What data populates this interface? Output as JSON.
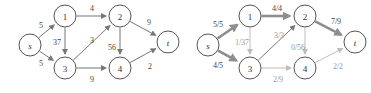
{
  "figure": {
    "title": "",
    "panels": [
      {
        "id": "left",
        "name": "capacity-network",
        "nodes": [
          {
            "id": "s",
            "label": "s",
            "x": 30,
            "y": 45,
            "r": 11,
            "italic": true
          },
          {
            "id": "n1",
            "label": "1",
            "x": 65,
            "y": 16,
            "r": 11,
            "italic": false
          },
          {
            "id": "n2",
            "label": "2",
            "x": 120,
            "y": 16,
            "r": 11,
            "italic": false
          },
          {
            "id": "n3",
            "label": "3",
            "x": 65,
            "y": 68,
            "r": 11,
            "italic": false
          },
          {
            "id": "n4",
            "label": "4",
            "x": 120,
            "y": 68,
            "r": 11,
            "italic": false
          },
          {
            "id": "t",
            "label": "t",
            "x": 168,
            "y": 42,
            "r": 11,
            "italic": true
          }
        ],
        "edges": [
          {
            "from": "s",
            "to": "n1",
            "label": "5",
            "lx": 41,
            "ly": 25,
            "style": "thin"
          },
          {
            "from": "s",
            "to": "n3",
            "label": "5",
            "lx": 41,
            "ly": 63,
            "style": "thin"
          },
          {
            "from": "n1",
            "to": "n2",
            "label": "4",
            "lx": 92,
            "ly": 8,
            "style": "thin"
          },
          {
            "from": "n1",
            "to": "n3",
            "label": "37",
            "lx": 57,
            "ly": 42,
            "style": "thin"
          },
          {
            "from": "n3",
            "to": "n2",
            "label": "3",
            "lx": 92,
            "ly": 40,
            "style": "thin"
          },
          {
            "from": "n2",
            "to": "n4",
            "label": "56",
            "lx": 112,
            "ly": 47,
            "style": "thin"
          },
          {
            "from": "n3",
            "to": "n4",
            "label": "9",
            "lx": 92,
            "ly": 79,
            "style": "thin"
          },
          {
            "from": "n2",
            "to": "t",
            "label": "9",
            "lx": 149,
            "ly": 22,
            "style": "thin"
          },
          {
            "from": "n4",
            "to": "t",
            "label": "2",
            "lx": 150,
            "ly": 66,
            "style": "thin"
          }
        ]
      },
      {
        "id": "right",
        "name": "flow-network",
        "nodes": [
          {
            "id": "s",
            "label": "s",
            "x": 208,
            "y": 45,
            "r": 11,
            "italic": true
          },
          {
            "id": "n1",
            "label": "1",
            "x": 250,
            "y": 16,
            "r": 11,
            "italic": false
          },
          {
            "id": "n2",
            "label": "2",
            "x": 305,
            "y": 16,
            "r": 11,
            "italic": false
          },
          {
            "id": "n3",
            "label": "3",
            "x": 250,
            "y": 68,
            "r": 11,
            "italic": false
          },
          {
            "id": "n4",
            "label": "4",
            "x": 305,
            "y": 68,
            "r": 11,
            "italic": false
          },
          {
            "id": "t",
            "label": "t",
            "x": 355,
            "y": 42,
            "r": 11,
            "italic": true
          }
        ],
        "edges": [
          {
            "from": "s",
            "to": "n1",
            "label": "5/5",
            "lx": 218,
            "ly": 24,
            "style": "thick",
            "dim": false
          },
          {
            "from": "s",
            "to": "n3",
            "label": "4/5",
            "lx": 218,
            "ly": 65,
            "style": "thick",
            "dim": false
          },
          {
            "from": "n1",
            "to": "n2",
            "label": "4/4",
            "lx": 277,
            "ly": 8,
            "style": "thick",
            "dim": false
          },
          {
            "from": "n1",
            "to": "n3",
            "label": "1/37",
            "lx": 242,
            "ly": 42,
            "style": "faint",
            "dim": true
          },
          {
            "from": "n3",
            "to": "n2",
            "label": "3/3",
            "lx": 279,
            "ly": 35,
            "style": "thin",
            "dim": true
          },
          {
            "from": "n2",
            "to": "n4",
            "label": "0/56",
            "lx": 298,
            "ly": 47,
            "style": "faint",
            "dim": true
          },
          {
            "from": "n3",
            "to": "n4",
            "label": "2/9",
            "lx": 278,
            "ly": 79,
            "style": "faint",
            "dim": true
          },
          {
            "from": "n2",
            "to": "t",
            "label": "7/9",
            "lx": 336,
            "ly": 21,
            "style": "thick",
            "dim": false
          },
          {
            "from": "n4",
            "to": "t",
            "label": "2/2",
            "lx": 338,
            "ly": 66,
            "style": "faint",
            "dim": true
          }
        ]
      }
    ]
  }
}
